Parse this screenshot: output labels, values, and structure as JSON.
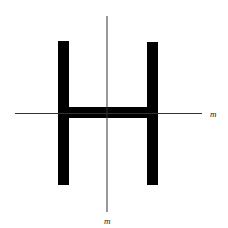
{
  "diagram": {
    "shape": "H-beam cross-section",
    "colors": {
      "shape": "#000000",
      "axis": "#333333",
      "background": "#ffffff"
    },
    "axes": {
      "horizontal": {
        "label": "m"
      },
      "vertical": {
        "label": "m"
      }
    }
  }
}
